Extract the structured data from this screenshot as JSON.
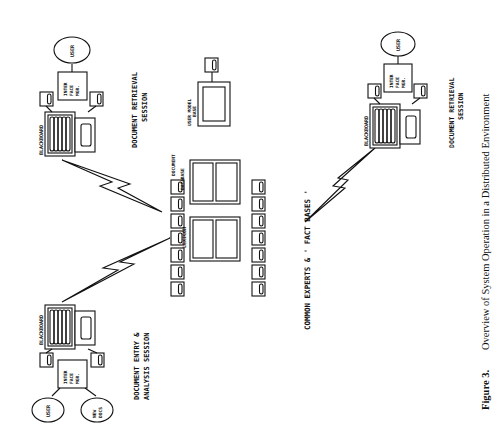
{
  "figure": {
    "number_label": "Figure 3.",
    "caption": "Overview of System Operation in a Distributed Environment"
  },
  "sessions": {
    "entry": {
      "title_line1": "DOCUMENT ENTRY &",
      "title_line2": "ANALYSIS SESSION",
      "blackboard": "BLACKBOARD",
      "interface_l1": "INTER",
      "interface_l2": "FACE",
      "interface_l3": "MGR.",
      "user": "USER",
      "new_docs_l1": "NEW",
      "new_docs_l2": "DOCS"
    },
    "retrieval_left": {
      "title_line1": "DOCUMENT RETRIEVAL",
      "title_line2": "SESSION",
      "blackboard": "BLACKBOARD",
      "interface_l1": "INTER",
      "interface_l2": "FACE",
      "interface_l3": "MGR.",
      "user": "USER"
    },
    "retrieval_right": {
      "title_line1": "DOCUMENT RETRIEVAL",
      "title_line2": "SESSION",
      "blackboard": "BLACKBOARD",
      "interface_l1": "INTER",
      "interface_l2": "FACE",
      "interface_l3": "MGR.",
      "user": "USER"
    }
  },
  "common": {
    "title": "COMMON EXPERTS & ' FACT BASES '",
    "document_database_l1": "DOCUMENT",
    "document_database_l2": "DATABASE",
    "lexicon": "LEXICON",
    "user_model_l1": "USER MODEL",
    "user_model_l2": "BASE"
  }
}
